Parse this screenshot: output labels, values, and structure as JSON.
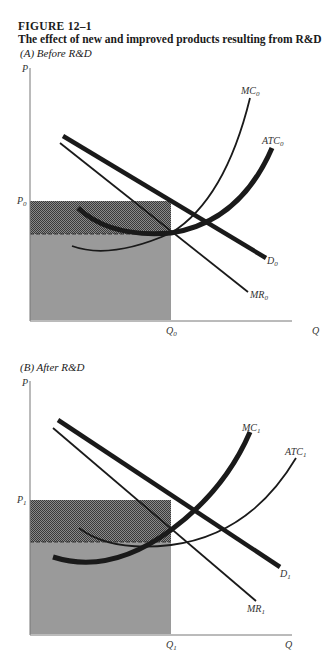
{
  "figure": {
    "number": "FIGURE 12–1",
    "title": "The effect of new and improved products resulting from R&D"
  },
  "panels": [
    {
      "title": "(A) Before R&D",
      "axis": {
        "y_label": "P",
        "x_label": "Q"
      },
      "price_label": "P",
      "price_sub": "0",
      "quantity_label": "Q",
      "quantity_sub": "0",
      "curves": {
        "mc": {
          "label": "MC",
          "sub": "0"
        },
        "atc": {
          "label": "ATC",
          "sub": "0"
        },
        "demand": {
          "label": "D",
          "sub": "0"
        },
        "mr": {
          "label": "MR",
          "sub": "0"
        }
      }
    },
    {
      "title": "(B) After R&D",
      "axis": {
        "y_label": "P",
        "x_label": "Q"
      },
      "price_label": "P",
      "price_sub": "1",
      "quantity_label": "Q",
      "quantity_sub": "1",
      "curves": {
        "mc": {
          "label": "MC",
          "sub": "1"
        },
        "atc": {
          "label": "ATC",
          "sub": "1"
        },
        "demand": {
          "label": "D",
          "sub": "1"
        },
        "mr": {
          "label": "MR",
          "sub": "1"
        }
      }
    }
  ],
  "colors": {
    "cost_area": "#9a9a9a",
    "profit_area": "#5e5e5e",
    "curve": "#1a1a1a",
    "axis": "#777777"
  }
}
